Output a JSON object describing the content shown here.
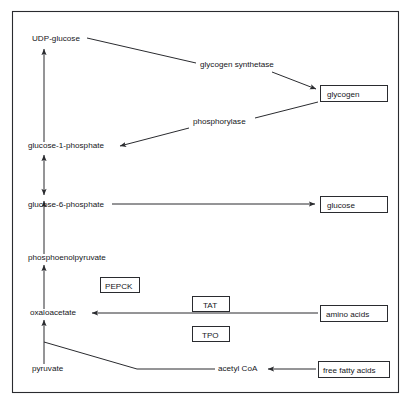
{
  "diagram": {
    "frame": {
      "x": 12,
      "y": 11,
      "width": 387,
      "height": 382
    },
    "colors": {
      "background": "#ffffff",
      "stroke": "#2a2b2f",
      "text": "#15161a",
      "box_fill": "#ffffff"
    },
    "metabolites": [
      {
        "id": "udp-glucose",
        "label": "UDP-glucose",
        "x": 32,
        "y": 41,
        "boxed": false
      },
      {
        "id": "glucose-1-phosphate",
        "label": "glucose-1-phosphate",
        "x": 28,
        "y": 148,
        "boxed": false
      },
      {
        "id": "glucose-6-phosphate",
        "label": "glucose-6-phosphate",
        "x": 28,
        "y": 207,
        "boxed": false
      },
      {
        "id": "phosphoenolpyruvate",
        "label": "phosphoenolpyruvate",
        "x": 28,
        "y": 260,
        "boxed": false
      },
      {
        "id": "oxaloacetate",
        "label": "oxaloacetate",
        "x": 30,
        "y": 315,
        "boxed": false
      },
      {
        "id": "pyruvate",
        "label": "pyruvate",
        "x": 32,
        "y": 371,
        "boxed": false
      },
      {
        "id": "acetyl-coa",
        "label": "acetyl CoA",
        "x": 218,
        "y": 371,
        "boxed": false
      }
    ],
    "boxed_nodes": [
      {
        "id": "glycogen",
        "label": "glycogen",
        "x": 320,
        "y": 85,
        "width": 68,
        "height": 17
      },
      {
        "id": "glucose",
        "label": "glucose",
        "x": 320,
        "y": 196,
        "width": 68,
        "height": 17
      },
      {
        "id": "amino-acids",
        "label": "amino acids",
        "x": 320,
        "y": 305,
        "width": 68,
        "height": 17
      },
      {
        "id": "free-fatty-acids",
        "label": "free fatty acids",
        "x": 318,
        "y": 361,
        "width": 72,
        "height": 17
      }
    ],
    "enzymes_plain": [
      {
        "id": "glycogen-synthetase",
        "label": "glycogen synthetase",
        "x": 200,
        "y": 67
      },
      {
        "id": "phosphorylase",
        "label": "phosphorylase",
        "x": 193,
        "y": 124
      }
    ],
    "enzymes_boxed": [
      {
        "id": "pepck",
        "label": "PEPCK",
        "x": 100,
        "y": 277,
        "width": 40,
        "height": 16
      },
      {
        "id": "tat",
        "label": "TAT",
        "x": 192,
        "y": 296,
        "width": 38,
        "height": 16
      },
      {
        "id": "tpo",
        "label": "TPO",
        "x": 192,
        "y": 326,
        "width": 38,
        "height": 16
      }
    ],
    "arrows": [
      {
        "id": "g1p-to-udp-glucose",
        "from": "glucose-1-phosphate",
        "to": "UDP-glucose",
        "direction": "up"
      },
      {
        "id": "g6p-to-g1p",
        "from": "glucose-6-phosphate",
        "to": "glucose-1-phosphate",
        "direction": "bidirectional"
      },
      {
        "id": "pep-to-g6p",
        "from": "phosphoenolpyruvate",
        "to": "glucose-6-phosphate",
        "direction": "up"
      },
      {
        "id": "oaa-to-pep",
        "from": "oxaloacetate",
        "to": "phosphoenolpyruvate",
        "direction": "up"
      },
      {
        "id": "pyruvate-to-oaa",
        "from": "pyruvate",
        "to": "oxaloacetate",
        "direction": "up"
      },
      {
        "id": "udp-glucose-to-glycogen",
        "from": "UDP-glucose",
        "to": "glycogen",
        "direction": "right",
        "enzyme": "glycogen synthetase"
      },
      {
        "id": "glycogen-to-g1p",
        "from": "glycogen",
        "to": "glucose-1-phosphate",
        "direction": "left",
        "enzyme": "phosphorylase"
      },
      {
        "id": "g6p-to-glucose",
        "from": "glucose-6-phosphate",
        "to": "glucose",
        "direction": "right"
      },
      {
        "id": "amino-acids-to-oaa",
        "from": "amino acids",
        "to": "oxaloacetate",
        "direction": "left",
        "enzyme": "TAT / TPO"
      },
      {
        "id": "ffa-to-acetyl-coa",
        "from": "free fatty acids",
        "to": "acetyl CoA",
        "direction": "left"
      },
      {
        "id": "pyruvate-to-acetyl-coa",
        "from": "pyruvate",
        "to": "acetyl CoA",
        "direction": "right"
      }
    ]
  }
}
